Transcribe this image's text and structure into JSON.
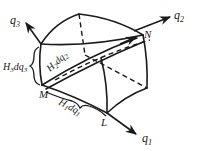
{
  "diagram": {
    "axes": {
      "q1": {
        "label": "q",
        "sub": "1"
      },
      "q2": {
        "label": "q",
        "sub": "2"
      },
      "q3": {
        "label": "q",
        "sub": "3"
      }
    },
    "points": {
      "M": "M",
      "L": "L",
      "N": "N"
    },
    "edges": {
      "e1": {
        "H": "H",
        "Hsub": "1",
        "dq": "dq",
        "dqsub": "1"
      },
      "e2": {
        "H": "H",
        "Hsub": "2",
        "dq": "dq",
        "dqsub": "2"
      },
      "e3": {
        "H": "H",
        "Hsub": "3",
        "dq": "dq",
        "dqsub": "3"
      }
    },
    "colors": {
      "stroke": "#1a1a1a",
      "background": "#ffffff"
    }
  }
}
